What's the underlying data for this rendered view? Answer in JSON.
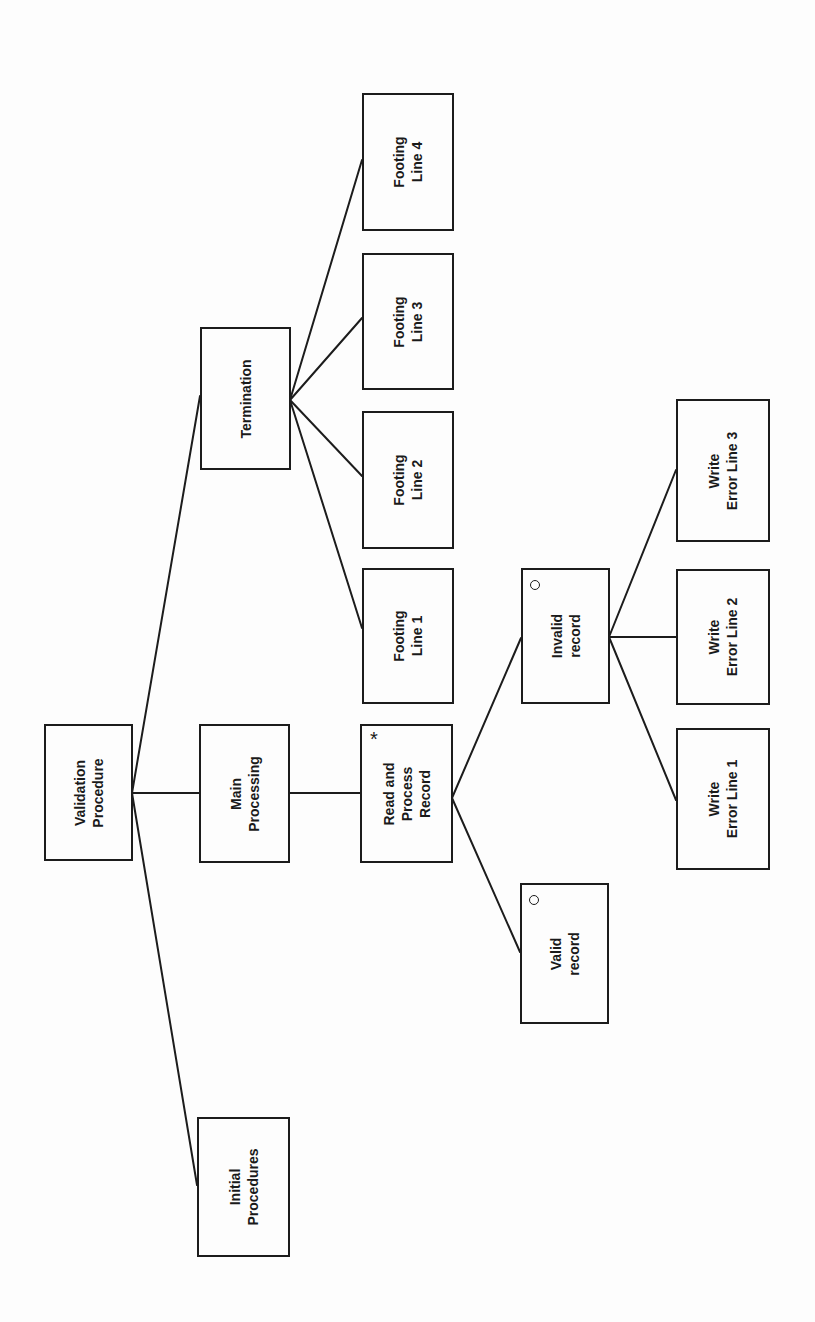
{
  "diagram": {
    "type": "Jackson structure diagram (rotated 90° counter-clockwise)",
    "colors": {
      "line": "#1c1c1c",
      "background": "#fdfdfd",
      "text": "#1a1a1a"
    },
    "nodes": {
      "validation_procedure": {
        "label": "Validation\nProcedure",
        "marker": ""
      },
      "initial_procedures": {
        "label": "Initial\nProcedures",
        "marker": ""
      },
      "main_processing": {
        "label": "Main\nProcessing",
        "marker": ""
      },
      "termination": {
        "label": "Termination",
        "marker": ""
      },
      "read_process_record": {
        "label": "Read and\nProcess\nRecord",
        "marker": "*"
      },
      "valid_record": {
        "label": "Valid\nrecord",
        "marker": "o"
      },
      "invalid_record": {
        "label": "Invalid\nrecord",
        "marker": "o"
      },
      "write_error_1": {
        "label": "Write\nError Line 1",
        "marker": ""
      },
      "write_error_2": {
        "label": "Write\nError Line 2",
        "marker": ""
      },
      "write_error_3": {
        "label": "Write\nError Line 3",
        "marker": ""
      },
      "footing_1": {
        "label": "Footing\nLine 1",
        "marker": ""
      },
      "footing_2": {
        "label": "Footing\nLine 2",
        "marker": ""
      },
      "footing_3": {
        "label": "Footing\nLine 3",
        "marker": ""
      },
      "footing_4": {
        "label": "Footing\nLine 4",
        "marker": ""
      }
    },
    "edges": [
      [
        "Validation Procedure",
        "Initial Procedures"
      ],
      [
        "Validation Procedure",
        "Main Processing"
      ],
      [
        "Validation Procedure",
        "Termination"
      ],
      [
        "Main Processing",
        "Read and Process Record"
      ],
      [
        "Read and Process Record",
        "Valid record"
      ],
      [
        "Read and Process Record",
        "Invalid record"
      ],
      [
        "Invalid record",
        "Write Error Line 1"
      ],
      [
        "Invalid record",
        "Write Error Line 2"
      ],
      [
        "Invalid record",
        "Write Error Line 3"
      ],
      [
        "Termination",
        "Footing Line 1"
      ],
      [
        "Termination",
        "Footing Line 2"
      ],
      [
        "Termination",
        "Footing Line 3"
      ],
      [
        "Termination",
        "Footing Line 4"
      ]
    ]
  }
}
